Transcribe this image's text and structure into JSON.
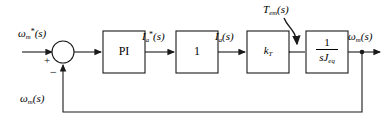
{
  "diagram": {
    "type": "control-block-diagram",
    "labels": {
      "input_reference": "ω*m(s)",
      "current_reference": "I*a(s)",
      "current_feedback": "Ia(s)",
      "torque_disturbance": "Tem(s)",
      "output_speed": "ωm(s)",
      "feedback_speed": "ωm(s)"
    },
    "blocks": [
      {
        "id": "pi",
        "label": "PI",
        "kind": "text"
      },
      {
        "id": "unity",
        "label": "1",
        "kind": "text"
      },
      {
        "id": "torque",
        "label": "kT",
        "kind": "text"
      },
      {
        "id": "inertia",
        "numerator": "1",
        "denominator": "sJeq",
        "kind": "fraction"
      }
    ],
    "summing_junctions": [
      {
        "id": "error-summer",
        "shape": "circle",
        "inputs": [
          "+",
          "-"
        ]
      },
      {
        "id": "torque-summer",
        "shape": "node"
      }
    ],
    "signs": {
      "reference_sign": "+",
      "feedback_sign": "−"
    },
    "colors": {
      "line": "#1a1a1a",
      "background": "#ffffff",
      "text": "#000000"
    }
  }
}
